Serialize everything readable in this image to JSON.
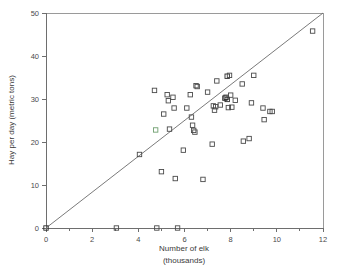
{
  "chart_data": {
    "type": "scatter",
    "title": "",
    "xlabel": "Number of elk",
    "xlabel_line2": "(thousands)",
    "ylabel": "Hay per day (metric tons)",
    "xlim": [
      0,
      12
    ],
    "ylim": [
      0,
      50
    ],
    "xticks": [
      0,
      2,
      4,
      6,
      8,
      10,
      12
    ],
    "yticks": [
      0,
      10,
      20,
      30,
      40,
      50
    ],
    "xtick_labels": [
      "0",
      "2",
      "4",
      "6",
      "8",
      "10",
      "12"
    ],
    "ytick_labels": [
      "0",
      "10",
      "20",
      "30",
      "40",
      "50"
    ],
    "grid": false,
    "legend": "none",
    "marker": "open-square",
    "reference_line": {
      "name": "diagonal-reference-line",
      "from": [
        0,
        0
      ],
      "to": [
        12,
        50
      ],
      "slope": 4.1667,
      "intercept": 0
    },
    "points": [
      {
        "x": 0.0,
        "y": 0.0,
        "color": "dark"
      },
      {
        "x": 3.05,
        "y": 0.0,
        "color": "gray"
      },
      {
        "x": 4.8,
        "y": 0.0,
        "color": "gray"
      },
      {
        "x": 5.7,
        "y": 0.0,
        "color": "gray"
      },
      {
        "x": 4.05,
        "y": 17.1,
        "color": "gray"
      },
      {
        "x": 4.7,
        "y": 32.0,
        "color": "gray"
      },
      {
        "x": 4.75,
        "y": 22.8,
        "color": "green"
      },
      {
        "x": 5.0,
        "y": 13.1,
        "color": "gray"
      },
      {
        "x": 5.1,
        "y": 26.5,
        "color": "gray"
      },
      {
        "x": 5.25,
        "y": 31.0,
        "color": "gray"
      },
      {
        "x": 5.3,
        "y": 29.6,
        "color": "gray"
      },
      {
        "x": 5.35,
        "y": 23.0,
        "color": "gray"
      },
      {
        "x": 5.5,
        "y": 30.4,
        "color": "gray"
      },
      {
        "x": 5.55,
        "y": 27.9,
        "color": "gray"
      },
      {
        "x": 5.6,
        "y": 11.5,
        "color": "gray"
      },
      {
        "x": 5.95,
        "y": 18.1,
        "color": "gray"
      },
      {
        "x": 6.1,
        "y": 27.9,
        "color": "gray"
      },
      {
        "x": 6.25,
        "y": 31.0,
        "color": "gray"
      },
      {
        "x": 6.3,
        "y": 25.8,
        "color": "gray"
      },
      {
        "x": 6.35,
        "y": 23.9,
        "color": "gray"
      },
      {
        "x": 6.4,
        "y": 22.7,
        "color": "gray"
      },
      {
        "x": 6.45,
        "y": 22.3,
        "color": "gray"
      },
      {
        "x": 6.5,
        "y": 33.1,
        "color": "gray"
      },
      {
        "x": 6.55,
        "y": 32.9,
        "color": "gray"
      },
      {
        "x": 6.8,
        "y": 11.3,
        "color": "gray"
      },
      {
        "x": 7.0,
        "y": 31.6,
        "color": "gray"
      },
      {
        "x": 7.2,
        "y": 19.5,
        "color": "gray"
      },
      {
        "x": 7.25,
        "y": 28.4,
        "color": "gray"
      },
      {
        "x": 7.3,
        "y": 27.4,
        "color": "gray"
      },
      {
        "x": 7.35,
        "y": 28.2,
        "color": "gray"
      },
      {
        "x": 7.4,
        "y": 34.2,
        "color": "gray"
      },
      {
        "x": 7.55,
        "y": 28.6,
        "color": "gray"
      },
      {
        "x": 7.75,
        "y": 30.2,
        "color": "dark"
      },
      {
        "x": 7.8,
        "y": 30.4,
        "color": "dark"
      },
      {
        "x": 7.85,
        "y": 35.3,
        "color": "dark"
      },
      {
        "x": 7.85,
        "y": 29.9,
        "color": "dark"
      },
      {
        "x": 7.9,
        "y": 28.0,
        "color": "gray"
      },
      {
        "x": 7.95,
        "y": 35.5,
        "color": "gray"
      },
      {
        "x": 8.0,
        "y": 30.9,
        "color": "gray"
      },
      {
        "x": 8.05,
        "y": 28.1,
        "color": "gray"
      },
      {
        "x": 8.2,
        "y": 29.7,
        "color": "gray"
      },
      {
        "x": 8.5,
        "y": 33.5,
        "color": "gray"
      },
      {
        "x": 8.55,
        "y": 20.2,
        "color": "gray"
      },
      {
        "x": 8.8,
        "y": 20.8,
        "color": "gray"
      },
      {
        "x": 8.9,
        "y": 29.1,
        "color": "gray"
      },
      {
        "x": 9.0,
        "y": 35.5,
        "color": "gray"
      },
      {
        "x": 9.4,
        "y": 27.9,
        "color": "gray"
      },
      {
        "x": 9.45,
        "y": 25.2,
        "color": "gray"
      },
      {
        "x": 9.7,
        "y": 27.1,
        "color": "gray"
      },
      {
        "x": 9.8,
        "y": 27.1,
        "color": "gray"
      },
      {
        "x": 11.55,
        "y": 45.8,
        "color": "gray"
      }
    ]
  }
}
